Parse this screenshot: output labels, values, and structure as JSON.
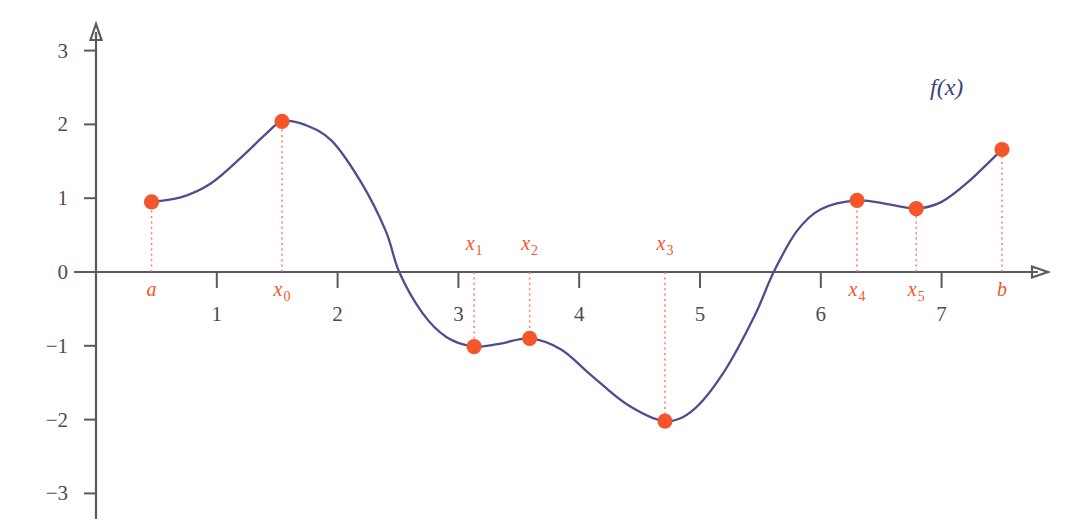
{
  "chart_data": {
    "type": "line",
    "title": "",
    "subtitle": "",
    "xlabel": "",
    "ylabel": "",
    "xlim": [
      -0.2,
      8.2
    ],
    "ylim": [
      -3.4,
      3.4
    ],
    "grid": false,
    "legend_position": "inside-top-right",
    "series_label": "f(x)",
    "x_ticks": [
      {
        "value": 1,
        "label": "1"
      },
      {
        "value": 2,
        "label": "2"
      },
      {
        "value": 3,
        "label": "3"
      },
      {
        "value": 4,
        "label": "4"
      },
      {
        "value": 5,
        "label": "5"
      },
      {
        "value": 6,
        "label": "6"
      },
      {
        "value": 7,
        "label": "7"
      }
    ],
    "y_ticks": [
      {
        "value": 3,
        "label": "3"
      },
      {
        "value": 2,
        "label": "2"
      },
      {
        "value": 1,
        "label": "1"
      },
      {
        "value": 0,
        "label": "0"
      },
      {
        "value": -1,
        "label": "−1"
      },
      {
        "value": -2,
        "label": "−2"
      },
      {
        "value": -3,
        "label": "−3"
      }
    ],
    "annotated_points": [
      {
        "id": "a",
        "base": "a",
        "sub": "",
        "x": 0.46,
        "y": 0.95,
        "label_side": "below"
      },
      {
        "id": "x0",
        "base": "x",
        "sub": "0",
        "x": 1.54,
        "y": 2.04,
        "label_side": "below"
      },
      {
        "id": "x1",
        "base": "x",
        "sub": "1",
        "x": 3.13,
        "y": -1.01,
        "label_side": "above"
      },
      {
        "id": "x2",
        "base": "x",
        "sub": "2",
        "x": 3.59,
        "y": -0.9,
        "label_side": "above"
      },
      {
        "id": "x3",
        "base": "x",
        "sub": "3",
        "x": 4.71,
        "y": -2.02,
        "label_side": "above"
      },
      {
        "id": "x4",
        "base": "x",
        "sub": "4",
        "x": 6.3,
        "y": 0.97,
        "label_side": "below"
      },
      {
        "id": "x5",
        "base": "x",
        "sub": "5",
        "x": 6.79,
        "y": 0.86,
        "label_side": "below"
      },
      {
        "id": "b",
        "base": "b",
        "sub": "",
        "x": 7.5,
        "y": 1.66,
        "label_side": "below"
      }
    ],
    "zero_crossings": [
      2.51,
      5.61
    ],
    "curve_samples": [
      {
        "x": 0.46,
        "y": 0.95
      },
      {
        "x": 0.7,
        "y": 1.01
      },
      {
        "x": 0.95,
        "y": 1.2
      },
      {
        "x": 1.2,
        "y": 1.55
      },
      {
        "x": 1.4,
        "y": 1.86
      },
      {
        "x": 1.54,
        "y": 2.04
      },
      {
        "x": 1.72,
        "y": 2.0
      },
      {
        "x": 1.95,
        "y": 1.78
      },
      {
        "x": 2.2,
        "y": 1.2
      },
      {
        "x": 2.4,
        "y": 0.55
      },
      {
        "x": 2.51,
        "y": 0.0
      },
      {
        "x": 2.7,
        "y": -0.55
      },
      {
        "x": 2.9,
        "y": -0.88
      },
      {
        "x": 3.13,
        "y": -1.01
      },
      {
        "x": 3.35,
        "y": -0.97
      },
      {
        "x": 3.59,
        "y": -0.9
      },
      {
        "x": 3.85,
        "y": -1.05
      },
      {
        "x": 4.1,
        "y": -1.4
      },
      {
        "x": 4.4,
        "y": -1.8
      },
      {
        "x": 4.71,
        "y": -2.02
      },
      {
        "x": 4.95,
        "y": -1.86
      },
      {
        "x": 5.2,
        "y": -1.35
      },
      {
        "x": 5.45,
        "y": -0.6
      },
      {
        "x": 5.61,
        "y": 0.0
      },
      {
        "x": 5.8,
        "y": 0.55
      },
      {
        "x": 6.0,
        "y": 0.85
      },
      {
        "x": 6.3,
        "y": 0.97
      },
      {
        "x": 6.55,
        "y": 0.92
      },
      {
        "x": 6.79,
        "y": 0.86
      },
      {
        "x": 7.0,
        "y": 0.95
      },
      {
        "x": 7.22,
        "y": 1.22
      },
      {
        "x": 7.5,
        "y": 1.66
      }
    ]
  },
  "axes": {
    "x_axis_arrow": "arrow-right",
    "y_axis_arrow": "arrow-up"
  }
}
